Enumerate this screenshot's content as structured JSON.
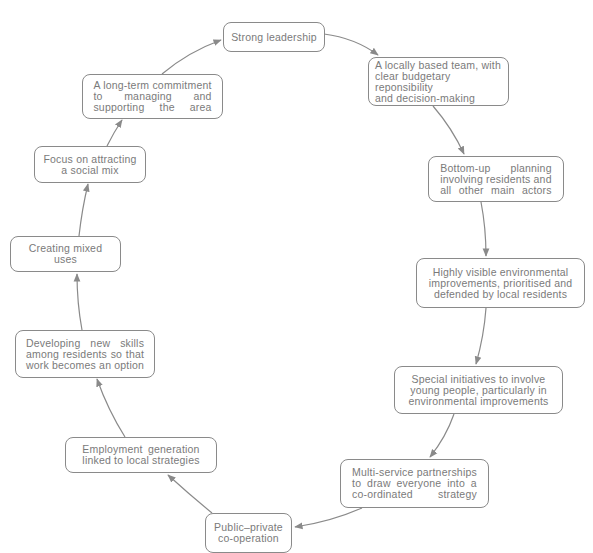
{
  "diagram": {
    "type": "cycle",
    "stroke_color": "#8a8a8a",
    "text_color": "#7a7a7a",
    "nodes": [
      {
        "id": "strong-leadership",
        "label": "Strong leadership"
      },
      {
        "id": "locally-based-team",
        "label": "A locally based team, with\nclear budgetary reponsibility\nand decision-making"
      },
      {
        "id": "bottom-up-planning",
        "label": "Bottom-up planning\ninvolving residents and\nall other main actors"
      },
      {
        "id": "environmental-improvements",
        "label": "Highly visible environmental\nimprovements, prioritised and\ndefended by local residents"
      },
      {
        "id": "youth-initiatives",
        "label": "Special initiatives to involve\nyoung people, particularly in\nenvironmental improvements"
      },
      {
        "id": "multi-service-partnerships",
        "label": "Multi-service partnerships\nto draw everyone into a\nco-ordinated strategy"
      },
      {
        "id": "public-private",
        "label": "Public–private\nco-operation"
      },
      {
        "id": "employment-generation",
        "label": "Employment generation\nlinked to local strategies"
      },
      {
        "id": "developing-skills",
        "label": "Developing new skills\namong residents so that\nwork becomes an option"
      },
      {
        "id": "mixed-uses",
        "label": "Creating mixed\nuses"
      },
      {
        "id": "social-mix",
        "label": "Focus on attracting\na social mix"
      },
      {
        "id": "long-term-commitment",
        "label": "A long-term commitment\nto managing and\nsupporting the area"
      }
    ],
    "edges": [
      {
        "from": "strong-leadership",
        "to": "locally-based-team"
      },
      {
        "from": "locally-based-team",
        "to": "bottom-up-planning"
      },
      {
        "from": "bottom-up-planning",
        "to": "environmental-improvements"
      },
      {
        "from": "environmental-improvements",
        "to": "youth-initiatives"
      },
      {
        "from": "youth-initiatives",
        "to": "multi-service-partnerships"
      },
      {
        "from": "multi-service-partnerships",
        "to": "public-private"
      },
      {
        "from": "public-private",
        "to": "employment-generation"
      },
      {
        "from": "employment-generation",
        "to": "developing-skills"
      },
      {
        "from": "developing-skills",
        "to": "mixed-uses"
      },
      {
        "from": "mixed-uses",
        "to": "social-mix"
      },
      {
        "from": "social-mix",
        "to": "long-term-commitment"
      },
      {
        "from": "long-term-commitment",
        "to": "strong-leadership"
      }
    ]
  }
}
